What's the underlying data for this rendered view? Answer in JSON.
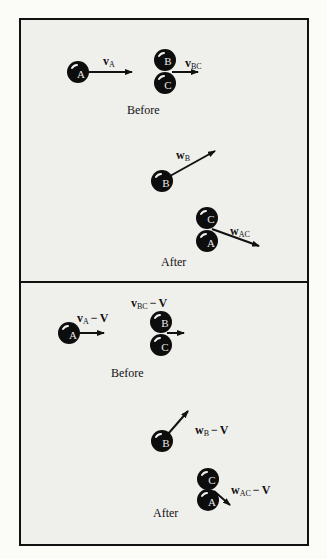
{
  "figure": {
    "panels": [
      {
        "id": "lab-frame",
        "before": {
          "caption": "Before",
          "balls": [
            {
              "label": "A",
              "cx": 78,
              "cy": 72
            },
            {
              "label": "B",
              "cx": 165,
              "cy": 60
            },
            {
              "label": "C",
              "cx": 165,
              "cy": 83
            }
          ],
          "vectors": [
            {
              "symbol": "v",
              "subscript": "A",
              "suffix": ""
            },
            {
              "symbol": "v",
              "subscript": "BC",
              "suffix": ""
            }
          ]
        },
        "after": {
          "caption": "After",
          "balls": [
            {
              "label": "B",
              "cx": 162,
              "cy": 181
            },
            {
              "label": "C",
              "cx": 207,
              "cy": 218
            },
            {
              "label": "A",
              "cx": 207,
              "cy": 241
            }
          ],
          "vectors": [
            {
              "symbol": "w",
              "subscript": "B",
              "suffix": ""
            },
            {
              "symbol": "w",
              "subscript": "AC",
              "suffix": ""
            }
          ]
        }
      },
      {
        "id": "cm-frame",
        "before": {
          "caption": "Before",
          "balls": [
            {
              "label": "A",
              "cx": 69,
              "cy": 333
            },
            {
              "label": "B",
              "cx": 161,
              "cy": 322
            },
            {
              "label": "C",
              "cx": 161,
              "cy": 345
            }
          ],
          "vectors": [
            {
              "symbol": "v",
              "subscript": "A",
              "minus": "−",
              "suffix": "V"
            },
            {
              "symbol": "v",
              "subscript": "BC",
              "minus": "−",
              "suffix": "V"
            }
          ]
        },
        "after": {
          "caption": "After",
          "balls": [
            {
              "label": "B",
              "cx": 162,
              "cy": 441
            },
            {
              "label": "C",
              "cx": 208,
              "cy": 479
            },
            {
              "label": "A",
              "cx": 208,
              "cy": 500
            }
          ],
          "vectors": [
            {
              "symbol": "w",
              "subscript": "B",
              "minus": "−",
              "suffix": "V"
            },
            {
              "symbol": "w",
              "subscript": "AC",
              "minus": "−",
              "suffix": "V"
            }
          ]
        }
      }
    ],
    "colors": {
      "ball": "#0d0d0d",
      "ball_highlight": "#f2f2f2",
      "ball_letter": "#e8e8e8",
      "arrow": "#111111",
      "panel_bg": "#efefec",
      "border": "#111111"
    }
  }
}
